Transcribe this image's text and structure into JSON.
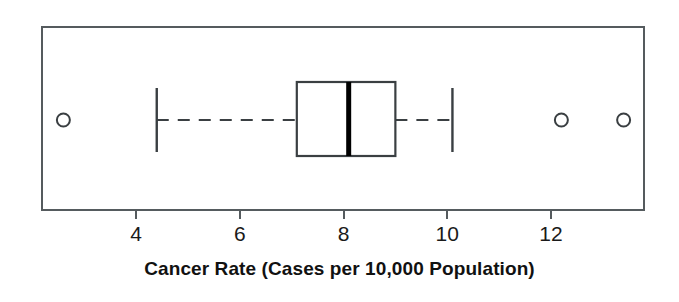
{
  "chart_data": {
    "type": "box",
    "title": "",
    "xlabel": "Cancer Rate (Cases per 10,000 Population)",
    "ylabel": "",
    "orientation": "horizontal",
    "grid": false,
    "legend": null,
    "xlim": [
      1.9,
      13.8
    ],
    "xticks": [
      4,
      6,
      8,
      10,
      12
    ],
    "xtick_labels": [
      "4",
      "6",
      "8",
      "10",
      "12"
    ],
    "boxes": [
      {
        "name": "Cancer Rate",
        "whisker_low": 4.4,
        "q1": 7.1,
        "median": 8.1,
        "q3": 9.0,
        "whisker_high": 10.1,
        "outliers": [
          2.6,
          12.2,
          13.4
        ],
        "whisker_style": "dashed",
        "box_fill": "#ffffff",
        "line_color": "#3a3f42",
        "median_color": "#000000"
      }
    ]
  },
  "figure": {
    "background": "#ffffff",
    "frame_color": "#555b5e",
    "axis_title": "Cancer Rate (Cases per 10,000 Population)",
    "tick_labels": [
      "4",
      "6",
      "8",
      "10",
      "12"
    ]
  }
}
